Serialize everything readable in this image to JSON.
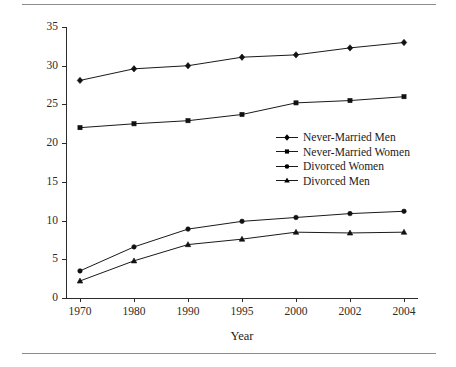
{
  "chart_data": {
    "type": "line",
    "title": "",
    "xlabel": "Year",
    "ylabel": "Percentage of All Men and of All Women",
    "categories": [
      "1970",
      "1980",
      "1990",
      "1995",
      "2000",
      "2002",
      "2004"
    ],
    "ylim": [
      0,
      35
    ],
    "yticks": [
      "0",
      "5",
      "10",
      "15",
      "20",
      "25",
      "30",
      "35"
    ],
    "grid": false,
    "legend_position": "center-right",
    "series": [
      {
        "name": "Never-Married Men",
        "marker": "diamond",
        "values": [
          28.1,
          29.6,
          30.0,
          31.1,
          31.4,
          32.3,
          33.0
        ]
      },
      {
        "name": "Never-Married Women",
        "marker": "square",
        "values": [
          22.0,
          22.5,
          22.9,
          23.7,
          25.2,
          25.5,
          26.0
        ]
      },
      {
        "name": "Divorced Women",
        "marker": "circle",
        "values": [
          3.5,
          6.6,
          8.9,
          9.9,
          10.4,
          10.9,
          11.2
        ]
      },
      {
        "name": "Divorced Men",
        "marker": "triangle",
        "values": [
          2.2,
          4.8,
          6.9,
          7.6,
          8.5,
          8.4,
          8.5
        ]
      }
    ],
    "colors": {
      "line": "#1a1a1a",
      "marker": "#111111",
      "axis": "#2b2b2b",
      "rule": "#8d8d8d",
      "background": "#ffffff"
    }
  }
}
